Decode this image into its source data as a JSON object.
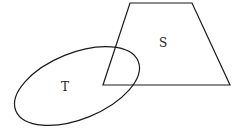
{
  "diagram": {
    "type": "set-overlap",
    "background": "#ffffff",
    "stroke_color": "#1a1a1a",
    "shapes": [
      {
        "id": "S",
        "kind": "trapezoid",
        "label": "S",
        "points": "130,3 192,3 230,85 103,85",
        "label_pos": [
          163,
          47
        ]
      },
      {
        "id": "T",
        "kind": "ellipse",
        "label": "T",
        "cx": 77,
        "cy": 86,
        "rx": 66,
        "ry": 33,
        "rotate": -22,
        "label_pos": [
          65,
          91
        ]
      }
    ]
  }
}
